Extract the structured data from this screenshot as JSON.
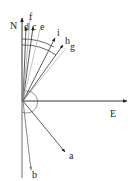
{
  "diagram": {
    "type": "vector-direction-diagram",
    "origin": [
      23,
      101
    ],
    "axes": [
      {
        "id": "N",
        "label": "N",
        "tip": [
          22,
          16
        ],
        "label_pos": [
          10,
          29
        ]
      },
      {
        "id": "E",
        "label": "E",
        "tip": [
          128,
          101
        ],
        "label_pos": [
          110,
          117
        ]
      }
    ],
    "vectors": [
      {
        "id": "a",
        "label": "a",
        "tip": [
          66,
          153
        ],
        "label_pos": [
          69,
          159
        ],
        "color": "#333333"
      },
      {
        "id": "b",
        "label": "b",
        "tip": [
          31,
          171
        ],
        "label_pos": [
          32,
          178
        ],
        "color": "#555555"
      },
      {
        "id": "c",
        "label": "c",
        "tip": [
          33,
          26
        ],
        "label_pos": [
          33,
          30
        ],
        "color": "#444444"
      },
      {
        "id": "d",
        "label": "d",
        "tip": [
          26,
          26
        ],
        "label_pos": [
          25,
          30
        ],
        "color": "#444444"
      },
      {
        "id": "e",
        "label": "e",
        "tip": [
          40,
          28
        ],
        "label_pos": [
          40,
          30
        ],
        "color": "#aaaaaa"
      },
      {
        "id": "f",
        "label": "f",
        "tip": [
          30,
          18
        ],
        "label_pos": [
          29,
          19
        ],
        "color": "#999999"
      },
      {
        "id": "g",
        "label": "g",
        "tip": [
          64,
          46
        ],
        "label_pos": [
          71,
          50
        ],
        "color": "#888888"
      },
      {
        "id": "h",
        "label": "h",
        "tip": [
          63,
          44
        ],
        "label_pos": [
          66,
          44
        ],
        "color": "#333333"
      },
      {
        "id": "i",
        "label": "i",
        "tip": [
          55,
          37
        ],
        "label_pos": [
          57,
          35
        ],
        "color": "#333333"
      }
    ],
    "arcs": [
      {
        "id": "outer-arc",
        "radius": 62,
        "color": "#444444"
      },
      {
        "id": "inner-arc",
        "radius": 56,
        "color": "#444444"
      },
      {
        "id": "angle-arc",
        "radius": 11,
        "color": "#555555"
      }
    ]
  }
}
